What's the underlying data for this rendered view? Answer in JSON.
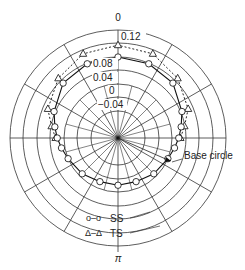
{
  "chart_data": {
    "type": "polar-line",
    "title": "",
    "angle_labels": {
      "top": "0",
      "bottom": "π"
    },
    "radial_tick_labels": [
      "0.12",
      "0.08",
      "0.04",
      "0",
      "-0.04"
    ],
    "radial_range": [
      -0.08,
      0.12
    ],
    "annotations": [
      "Base circle"
    ],
    "legend": [
      {
        "marker": "o–o",
        "label": "SS",
        "style": "solid line, circle markers"
      },
      {
        "marker": "Δ–Δ",
        "label": "TS",
        "style": "dashed line, triangle markers"
      }
    ],
    "angles_deg": [
      0,
      22.5,
      45,
      67.5,
      80,
      90,
      100,
      112.5,
      135,
      157.5,
      180,
      202.5,
      225,
      247.5,
      260,
      270,
      280,
      292.5,
      315,
      337.5
    ],
    "series": [
      {
        "name": "SS",
        "marker": "circle",
        "values": [
          0.08,
          0.078,
          0.07,
          0.045,
          0.03,
          0.02,
          0.01,
          0.0,
          -0.01,
          -0.02,
          -0.02,
          -0.02,
          -0.01,
          0.0,
          0.01,
          0.02,
          0.03,
          0.045,
          0.07,
          0.078
        ]
      },
      {
        "name": "TS",
        "marker": "triangle",
        "values": [
          0.115,
          0.11,
          0.09,
          0.065,
          0.04,
          0.025,
          null,
          null,
          null,
          null,
          null,
          null,
          null,
          null,
          null,
          0.025,
          0.04,
          0.065,
          0.09,
          0.11
        ]
      }
    ],
    "grid": {
      "rings": 7,
      "spokes_deg": 30
    }
  },
  "labels": {
    "top": "0",
    "bottom": "π",
    "ticks": [
      "0.12",
      "0.08",
      "0.04",
      "0",
      "−0.04"
    ],
    "base_circle": "Base circle",
    "legend_ss_marker": "o–o",
    "legend_ss": "SS",
    "legend_ts_marker": "Δ–Δ",
    "legend_ts": "TS"
  }
}
